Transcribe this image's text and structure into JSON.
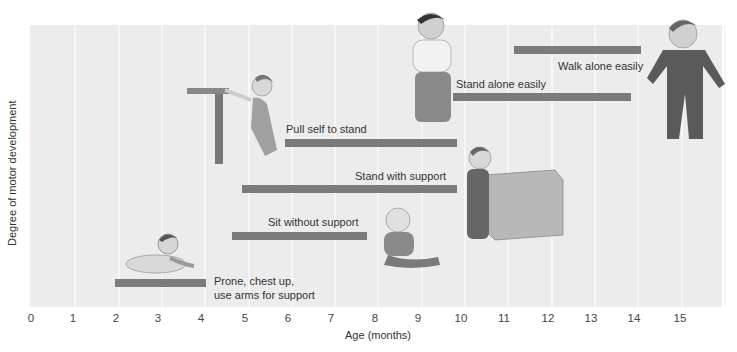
{
  "chart_data": {
    "type": "bar",
    "orientation": "horizontal-range",
    "title": "",
    "xlabel": "Age (months)",
    "ylabel": "Degree of motor development",
    "xlim": [
      0,
      16
    ],
    "xticks": [
      "0",
      "1",
      "2",
      "3",
      "4",
      "5",
      "6",
      "7",
      "8",
      "9",
      "10",
      "11",
      "12",
      "13",
      "14",
      "15"
    ],
    "grid": true,
    "legend": null,
    "bar_color": "#7b7b7b",
    "background_color": "#ececec",
    "series": [
      {
        "name": "Prone, chest up, use arms for support",
        "label_line1": "Prone, chest up,",
        "label_line2": "use arms for support",
        "start": 1.9,
        "end": 4.0,
        "level": 1
      },
      {
        "name": "Sit without support",
        "start": 4.6,
        "end": 7.8,
        "level": 2
      },
      {
        "name": "Stand with support",
        "start": 4.9,
        "end": 9.8,
        "level": 3
      },
      {
        "name": "Pull self to stand",
        "start": 5.9,
        "end": 9.8,
        "level": 4
      },
      {
        "name": "Stand alone easily",
        "start": 9.7,
        "end": 13.9,
        "level": 5
      },
      {
        "name": "Walk alone easily",
        "start": 11.2,
        "end": 14.1,
        "level": 6
      }
    ],
    "illustrations": [
      "infant-prone-chest-up",
      "infant-sitting",
      "infant-pulling-up-on-table",
      "toddler-standing-at-box",
      "toddler-standing-alone",
      "toddler-walking"
    ]
  }
}
